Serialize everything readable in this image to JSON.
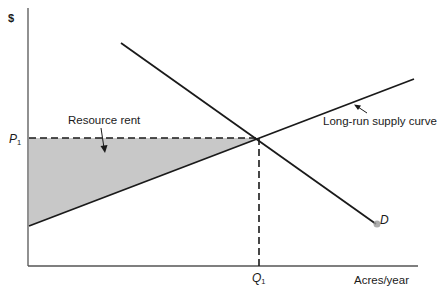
{
  "diagram": {
    "type": "economics supply-demand diagram",
    "y_axis_label": "$",
    "x_axis_label": "Acres/year",
    "price_label": {
      "main": "P",
      "sub": "1"
    },
    "quantity_label": {
      "main": "Q",
      "sub": "1"
    },
    "curves": {
      "supply": {
        "label": "Long-run supply curve"
      },
      "demand": {
        "label": "D"
      }
    },
    "shaded_region": {
      "label": "Resource rent",
      "fill": "#c8c8c8"
    },
    "colors": {
      "line": "#1a1a1a",
      "axis": "#555555",
      "shade": "#c8c8c8",
      "dot": "#9a9a9a"
    }
  }
}
